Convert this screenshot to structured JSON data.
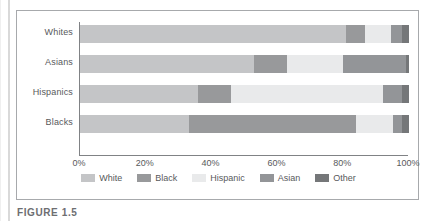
{
  "figure": {
    "caption": "FIGURE 1.5"
  },
  "chart_data": {
    "type": "bar",
    "orientation": "horizontal",
    "stacked": true,
    "normalized_percent": true,
    "title": "",
    "xlabel": "",
    "ylabel": "",
    "xlim": [
      0,
      100
    ],
    "grid": false,
    "legend_position": "bottom",
    "categories": [
      "Whites",
      "Asians",
      "Hispanics",
      "Blacks"
    ],
    "xtick_labels": [
      "0%",
      "20%",
      "40%",
      "60%",
      "80%",
      "100%"
    ],
    "xtick_values": [
      0,
      20,
      40,
      60,
      80,
      100
    ],
    "series": [
      {
        "name": "White",
        "color": "#c4c5c7",
        "values": [
          81,
          53,
          36,
          33
        ]
      },
      {
        "name": "Black",
        "color": "#98999b",
        "values": [
          5.5,
          10,
          10,
          51
        ]
      },
      {
        "name": "Hispanic",
        "color": "#e9eaeb",
        "values": [
          8,
          17,
          46,
          11
        ]
      },
      {
        "name": "Asian",
        "color": "#939598",
        "values": [
          3.5,
          19,
          6,
          3
        ]
      },
      {
        "name": "Other",
        "color": "#757779",
        "values": [
          2,
          1,
          2,
          2
        ]
      }
    ]
  }
}
